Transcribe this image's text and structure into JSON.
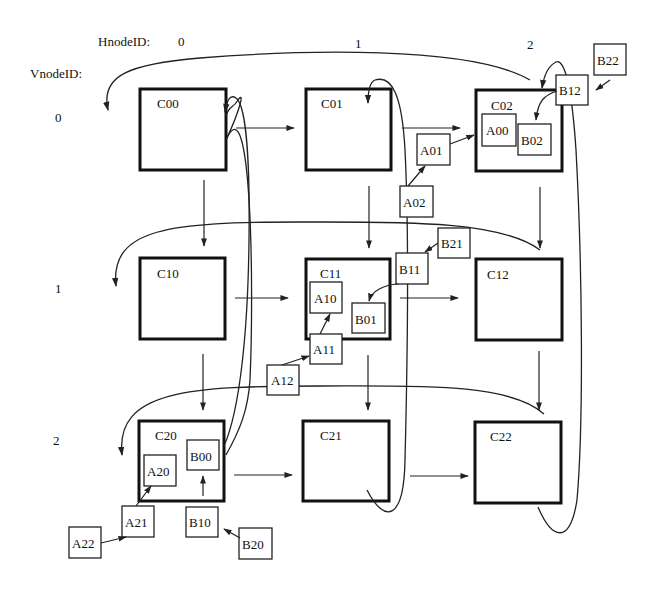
{
  "header": {
    "hnode_label": "HnodeID:",
    "vnode_label": "VnodeID:",
    "columns": [
      "0",
      "1",
      "2"
    ],
    "rows": [
      "0",
      "1",
      "2"
    ]
  },
  "cells": {
    "C00": "C00",
    "C01": "C01",
    "C02": "C02",
    "C10": "C10",
    "C11": "C11",
    "C12": "C12",
    "C20": "C20",
    "C21": "C21",
    "C22": "C22"
  },
  "blocks": {
    "A00": "A00",
    "A01": "A01",
    "A02": "A02",
    "A10": "A10",
    "A11": "A11",
    "A12": "A12",
    "A20": "A20",
    "A21": "A21",
    "A22": "A22",
    "B00": "B00",
    "B01": "B01",
    "B02": "B02",
    "B10": "B10",
    "B11": "B11",
    "B12": "B12",
    "B20": "B20",
    "B21": "B21",
    "B22": "B22"
  },
  "colors": {
    "ink": "#111111",
    "background": "#ffffff"
  }
}
